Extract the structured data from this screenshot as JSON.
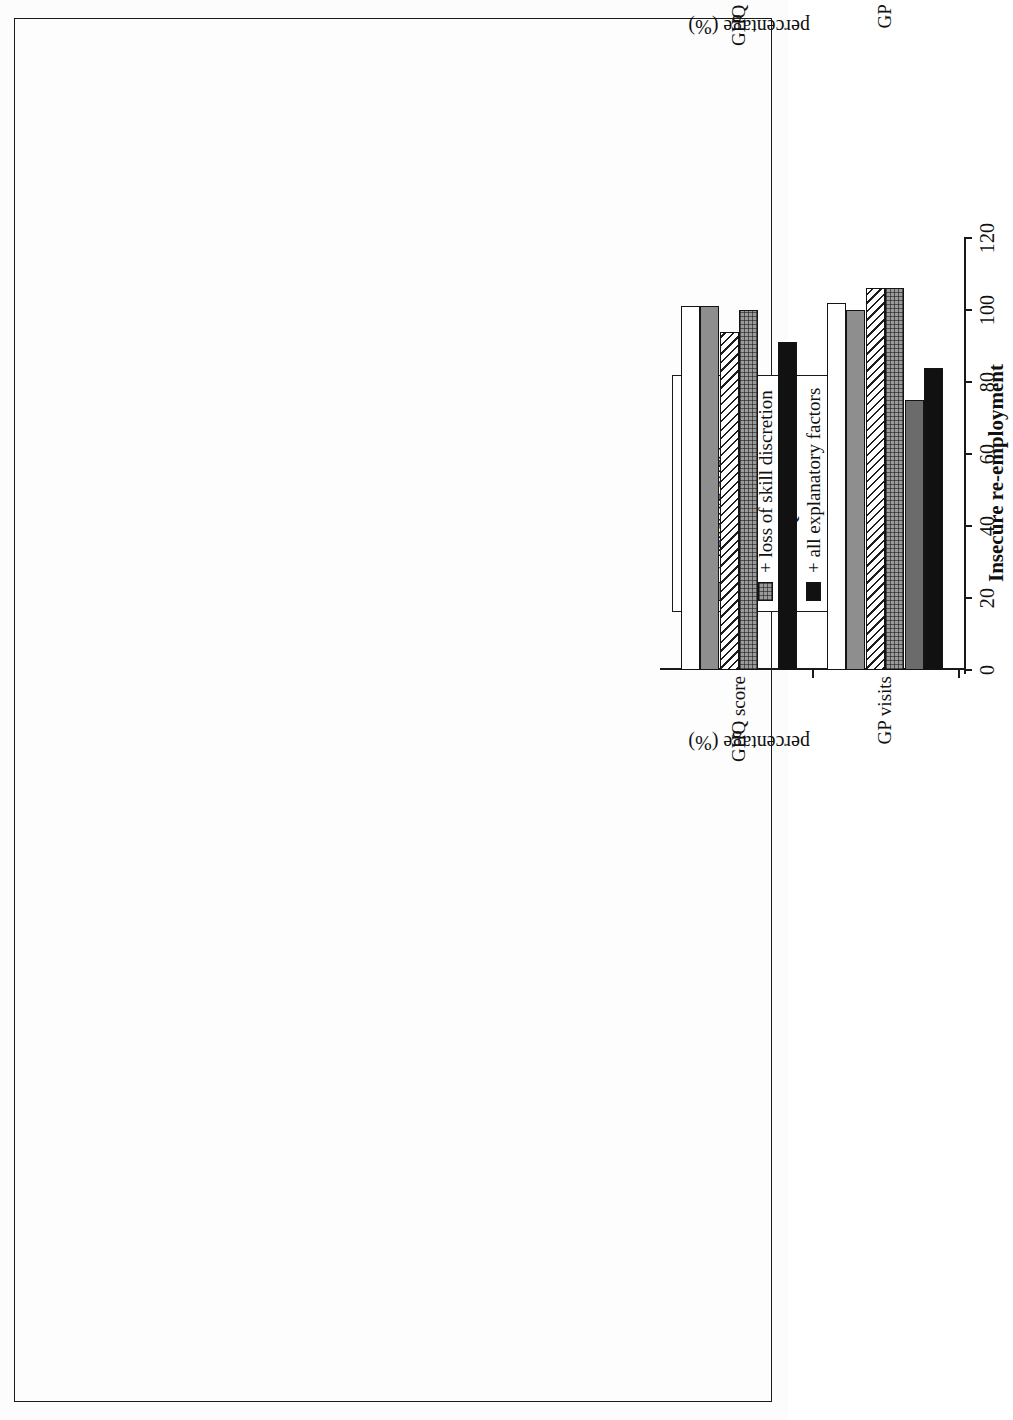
{
  "figure": {
    "orientation": "rotated-90",
    "panels": [
      "Unemployment",
      "Insecure re-employment"
    ]
  },
  "axis": {
    "y_title": "percentage (%)",
    "y_ticks": [
      "0",
      "20",
      "40",
      "60",
      "80",
      "100",
      "120"
    ],
    "y_min": 0,
    "y_max": 120,
    "categories": [
      "GHQ score",
      "GP visits"
    ]
  },
  "colors": {
    "unadjusted": "#ffffff",
    "negative_affect": "#8e8e8e",
    "hatched": "#ffffff",
    "checked": "#9a9a9a",
    "ghq_score": "#6b6b6b",
    "all_factors": "#111111",
    "ink": "#1a1a1a"
  },
  "chart_data": [
    {
      "type": "bar",
      "title": "Unemployment",
      "xlabel": "",
      "ylabel": "percentage (%)",
      "ylim": [
        0,
        120
      ],
      "grid": false,
      "legend_position": "upper-left",
      "categories": [
        "GHQ score",
        "GP visits"
      ],
      "series": [
        {
          "name": "unadjusted",
          "values": [
            100,
            101
          ]
        },
        {
          "name": "+ negative affect",
          "values": [
            100,
            97
          ]
        },
        {
          "name": "+ financial strain",
          "values": [
            91,
            91
          ]
        },
        {
          "name": "+ >=1hr vigorous exercise",
          "values": [
            101,
            112
          ]
        },
        {
          "name": "+ GHQ score",
          "values": [
            0,
            74
          ]
        },
        {
          "name": "+ all explanatory factors",
          "values": [
            94,
            80
          ]
        }
      ]
    },
    {
      "type": "bar",
      "title": "Insecure re-employment",
      "xlabel": "",
      "ylabel": "percentage (%)",
      "ylim": [
        0,
        120
      ],
      "grid": false,
      "legend_position": "upper-left",
      "categories": [
        "GHQ score",
        "GP visits"
      ],
      "series": [
        {
          "name": "unadjusted",
          "values": [
            101,
            102
          ]
        },
        {
          "name": "+ negative affect",
          "values": [
            101,
            100
          ]
        },
        {
          "name": "+ loss of job control",
          "values": [
            94,
            106
          ]
        },
        {
          "name": "+ loss of skill discretion",
          "values": [
            100,
            106
          ]
        },
        {
          "name": "+ GHQ score",
          "values": [
            0,
            75
          ]
        },
        {
          "name": "+ all explanatory factors",
          "values": [
            91,
            84
          ]
        }
      ]
    }
  ],
  "panel_top": {
    "title": "Unemployment",
    "y_title": "percentage (%)",
    "legend": [
      {
        "label": "unadjusted",
        "key": "unadjusted"
      },
      {
        "label": "+ negative affect",
        "key": "negative"
      },
      {
        "label": "+ financial strain",
        "key": "hatch"
      },
      {
        "label": "+ >=1hr vigorous exercise",
        "key": "check"
      },
      {
        "label": "+ GHQ score",
        "key": "ghq"
      },
      {
        "label": "+ all explanatory factors",
        "key": "all"
      }
    ],
    "cat0": "GHQ score",
    "cat1": "GP visits",
    "t0": "0",
    "t1": "20",
    "t2": "40",
    "t3": "60",
    "t4": "80",
    "t5": "100",
    "t6": "120"
  },
  "panel_bottom": {
    "title": "Insecure re-employment",
    "y_title": "percentage (%)",
    "legend": [
      {
        "label": "unadjusted",
        "key": "unadjusted"
      },
      {
        "label": "+ negative affect",
        "key": "negative"
      },
      {
        "label": "+ loss of job control",
        "key": "hatch"
      },
      {
        "label": "+ loss of skill discretion",
        "key": "check"
      },
      {
        "label": "+ GHQ score",
        "key": "ghq"
      },
      {
        "label": "+ all explanatory factors",
        "key": "all"
      }
    ],
    "cat0": "GHQ score",
    "cat1": "GP visits",
    "t0": "0",
    "t1": "20",
    "t2": "40",
    "t3": "60",
    "t4": "80",
    "t5": "100",
    "t6": "120"
  }
}
